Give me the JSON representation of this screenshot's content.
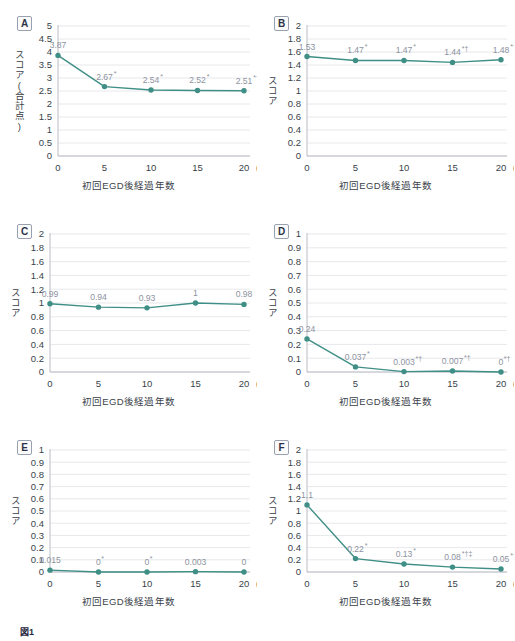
{
  "figure": {
    "caption_label": "図1",
    "caption_text": "　",
    "accent_color": "#3f8f86",
    "label_color": "#8d93a0",
    "grid_color": "#e7e8ec",
    "axis_color": "#b9bcc4"
  },
  "common": {
    "xlabel": "初回EGD後経過年数",
    "ylabel": "スコア",
    "x_unit": "(年)",
    "x_categories": [
      "0",
      "5",
      "10",
      "15",
      "20"
    ]
  },
  "chart_data": [
    {
      "panel": "A",
      "type": "line",
      "title": "",
      "xlabel": "初回EGD後経過年数",
      "ylabel": "スコア(合計点)",
      "ylabel_lines": [
        "スコア",
        "(合計点)"
      ],
      "categories": [
        "0",
        "5",
        "10",
        "15",
        "20"
      ],
      "x": [
        0,
        5,
        10,
        15,
        20
      ],
      "values": [
        3.87,
        2.67,
        2.54,
        2.52,
        2.51
      ],
      "point_labels": [
        "3.87",
        "2.67",
        "2.54",
        "2.52",
        "2.51"
      ],
      "significance": [
        "",
        "*",
        "*",
        "*",
        "*†‡"
      ],
      "ylim": [
        0,
        5
      ],
      "ytick_step": 0.5,
      "yticks": [
        "0",
        "0.5",
        "1",
        "1.5",
        "2",
        "2.5",
        "3",
        "3.5",
        "4",
        "4.5",
        "5"
      ],
      "grid": true,
      "legend": "none"
    },
    {
      "panel": "B",
      "type": "line",
      "title": "",
      "xlabel": "初回EGD後経過年数",
      "ylabel": "スコア",
      "ylabel_lines": [
        "スコア"
      ],
      "categories": [
        "0",
        "5",
        "10",
        "15",
        "20"
      ],
      "x": [
        0,
        5,
        10,
        15,
        20
      ],
      "values": [
        1.53,
        1.47,
        1.47,
        1.44,
        1.48
      ],
      "point_labels": [
        "1.53",
        "1.47",
        "1.47",
        "1.44",
        "1.48"
      ],
      "significance": [
        "",
        "*",
        "*",
        "*†",
        "*†‡"
      ],
      "ylim": [
        0,
        2
      ],
      "ytick_step": 0.2,
      "yticks": [
        "0",
        "0.2",
        "0.4",
        "0.6",
        "0.8",
        "1",
        "1.2",
        "1.4",
        "1.6",
        "1.8",
        "2"
      ],
      "grid": true,
      "legend": "none"
    },
    {
      "panel": "C",
      "type": "line",
      "title": "",
      "xlabel": "初回EGD後経過年数",
      "ylabel": "スコア",
      "ylabel_lines": [
        "スコア"
      ],
      "categories": [
        "0",
        "5",
        "10",
        "15",
        "20"
      ],
      "x": [
        0,
        5,
        10,
        15,
        20
      ],
      "values": [
        0.99,
        0.94,
        0.93,
        1,
        0.98
      ],
      "point_labels": [
        "0.99",
        "0.94",
        "0.93",
        "1",
        "0.98"
      ],
      "significance": [
        "",
        "",
        "",
        "",
        ""
      ],
      "ylim": [
        0,
        2
      ],
      "ytick_step": 0.2,
      "yticks": [
        "0",
        "0.2",
        "0.4",
        "0.6",
        "0.8",
        "1",
        "1.2",
        "1.4",
        "1.6",
        "1.8",
        "2"
      ],
      "grid": true,
      "legend": "none"
    },
    {
      "panel": "D",
      "type": "line",
      "title": "",
      "xlabel": "初回EGD後経過年数",
      "ylabel": "スコア",
      "ylabel_lines": [
        "スコア"
      ],
      "categories": [
        "0",
        "5",
        "10",
        "15",
        "20"
      ],
      "x": [
        0,
        5,
        10,
        15,
        20
      ],
      "values": [
        0.24,
        0.037,
        0.003,
        0.007,
        0
      ],
      "point_labels": [
        "0.24",
        "0.037",
        "0.003",
        "0.007",
        "0"
      ],
      "significance": [
        "",
        "*",
        "*†",
        "*†",
        "*†"
      ],
      "ylim": [
        0,
        1
      ],
      "ytick_step": 0.1,
      "yticks": [
        "0",
        "0.1",
        "0.2",
        "0.3",
        "0.4",
        "0.5",
        "0.6",
        "0.7",
        "0.8",
        "0.9",
        "1"
      ],
      "grid": true,
      "legend": "none"
    },
    {
      "panel": "E",
      "type": "line",
      "title": "",
      "xlabel": "初回EGD後経過年数",
      "ylabel": "スコア",
      "ylabel_lines": [
        "スコア"
      ],
      "categories": [
        "0",
        "5",
        "10",
        "15",
        "20"
      ],
      "x": [
        0,
        5,
        10,
        15,
        20
      ],
      "values": [
        0.015,
        0,
        0,
        0.003,
        0
      ],
      "point_labels": [
        "0.015",
        "0",
        "0",
        "0.003",
        "0"
      ],
      "significance": [
        "",
        "*",
        "*",
        "",
        ""
      ],
      "ylim": [
        0,
        1
      ],
      "ytick_step": 0.1,
      "yticks": [
        "0",
        "0.1",
        "0.2",
        "0.3",
        "0.4",
        "0.5",
        "0.6",
        "0.7",
        "0.8",
        "0.9",
        "1"
      ],
      "grid": true,
      "legend": "none"
    },
    {
      "panel": "F",
      "type": "line",
      "title": "",
      "xlabel": "初回EGD後経過年数",
      "ylabel": "スコア",
      "ylabel_lines": [
        "スコア"
      ],
      "categories": [
        "0",
        "5",
        "10",
        "15",
        "20"
      ],
      "x": [
        0,
        5,
        10,
        15,
        20
      ],
      "values": [
        1.1,
        0.22,
        0.13,
        0.08,
        0.05
      ],
      "point_labels": [
        "1.1",
        "0.22",
        "0.13",
        "0.08",
        "0.05"
      ],
      "significance": [
        "",
        "*",
        "*",
        "*†‡",
        "*†‡"
      ],
      "ylim": [
        0,
        2
      ],
      "ytick_step": 0.2,
      "yticks": [
        "0",
        "0.2",
        "0.4",
        "0.6",
        "0.8",
        "1",
        "1.2",
        "1.4",
        "1.6",
        "1.8",
        "2"
      ],
      "grid": true,
      "legend": "none"
    }
  ]
}
